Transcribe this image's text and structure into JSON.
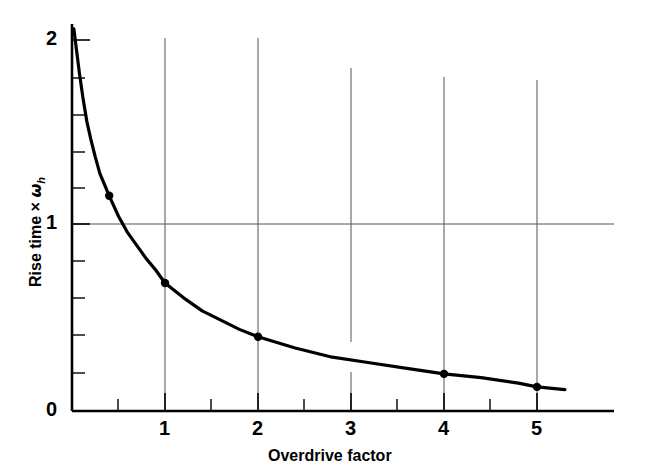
{
  "chart_data": {
    "type": "line",
    "title": "",
    "xlabel": "Overdrive factor",
    "ylabel": "Rise time × ωh",
    "ylabel_parts": {
      "text": "Rise time",
      "operator": "×",
      "symbol": "ω",
      "subscript": "h"
    },
    "xlim": [
      0,
      5.5
    ],
    "ylim": [
      0,
      2.1
    ],
    "xticks": [
      0,
      1,
      2,
      3,
      4,
      5
    ],
    "xtick_labels": [
      "0",
      "1",
      "2",
      "3",
      "4",
      "5"
    ],
    "xticks_minor": [
      0.5,
      1.5,
      2.5,
      3.5,
      4.5
    ],
    "yticks": [
      0,
      1,
      2
    ],
    "ytick_labels": [
      "0",
      "1",
      "2"
    ],
    "yticks_minor": [
      0.2,
      0.4,
      0.6,
      0.8,
      1.2,
      1.4,
      1.6,
      1.8
    ],
    "grid": true,
    "grid_lines_horizontal": [
      1
    ],
    "grid_lines_vertical": [
      1,
      2,
      3,
      4,
      5
    ],
    "legend": null,
    "series": [
      {
        "name": "Rise time vs overdrive factor",
        "x": [
          0.02,
          0.05,
          0.08,
          0.12,
          0.16,
          0.2,
          0.25,
          0.3,
          0.35,
          0.4,
          0.5,
          0.6,
          0.7,
          0.8,
          0.9,
          1.0,
          1.2,
          1.4,
          1.6,
          1.8,
          2.0,
          2.4,
          2.8,
          3.2,
          3.6,
          4.0,
          4.4,
          4.8,
          5.0,
          5.3
        ],
        "y": [
          2.06,
          1.94,
          1.82,
          1.68,
          1.56,
          1.47,
          1.37,
          1.28,
          1.22,
          1.16,
          1.05,
          0.96,
          0.89,
          0.82,
          0.76,
          0.69,
          0.61,
          0.54,
          0.49,
          0.44,
          0.4,
          0.34,
          0.29,
          0.26,
          0.23,
          0.2,
          0.18,
          0.15,
          0.13,
          0.115
        ]
      }
    ],
    "markers": [
      {
        "x": 0.4,
        "y": 1.16
      },
      {
        "x": 1.0,
        "y": 0.69
      },
      {
        "x": 2.0,
        "y": 0.4
      },
      {
        "x": 4.0,
        "y": 0.2
      },
      {
        "x": 5.0,
        "y": 0.13
      }
    ],
    "colors": {
      "curve": "#000000",
      "axis": "#000000",
      "grid": "#666666",
      "marker": "#000000",
      "background": "#ffffff"
    }
  },
  "axes": {
    "x_axis_label": "Overdrive factor",
    "y_axis_label_text": "Rise time",
    "y_axis_label_operator": "×",
    "y_axis_label_symbol": "ω",
    "y_axis_label_subscript": "h",
    "x_tick_0": "0",
    "x_tick_1": "1",
    "x_tick_2": "2",
    "x_tick_3": "3",
    "x_tick_4": "4",
    "x_tick_5": "5",
    "y_tick_0": "0",
    "y_tick_1": "1",
    "y_tick_2": "2"
  }
}
